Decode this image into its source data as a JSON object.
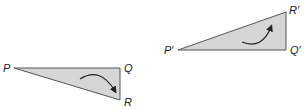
{
  "colors": {
    "fill": "#d6d6d6",
    "stroke": "#555555",
    "arrow": "#222222"
  },
  "triangles": [
    {
      "name": "original",
      "vertices": {
        "P": [
          14,
          68
        ],
        "Q": [
          120,
          68
        ],
        "R": [
          120,
          100
        ]
      },
      "labels": {
        "P": "P",
        "Q": "Q",
        "R": "R"
      },
      "rotation": "clockwise"
    },
    {
      "name": "image",
      "vertices": {
        "P": [
          178,
          50
        ],
        "Q": [
          286,
          50
        ],
        "R": [
          286,
          12
        ]
      },
      "labels": {
        "P": "P′",
        "Q": "Q′",
        "R": "R′"
      },
      "rotation": "counterclockwise"
    }
  ]
}
